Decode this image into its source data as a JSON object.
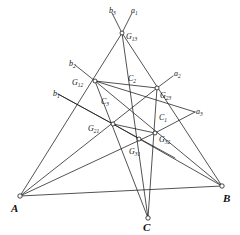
{
  "figure": {
    "stroke_color": "#1a1a1a",
    "node_fill": "#ffffff",
    "background": "#ffffff"
  },
  "vertices": [
    {
      "id": "A",
      "label": "A",
      "x": 20,
      "y": 196,
      "label_x": 11,
      "label_y": 203
    },
    {
      "id": "B",
      "label": "B",
      "x": 222,
      "y": 186,
      "label_x": 223,
      "label_y": 193
    },
    {
      "id": "C",
      "label": "C",
      "x": 148,
      "y": 218,
      "label_x": 143,
      "label_y": 222
    }
  ],
  "g_points": [
    {
      "id": "G13",
      "base": "G",
      "sub": "13",
      "x": 122,
      "y": 33,
      "label_x": 126,
      "label_y": 33
    },
    {
      "id": "G12",
      "base": "G",
      "sub": "12",
      "x": 95,
      "y": 81,
      "label_x": 72,
      "label_y": 79
    },
    {
      "id": "G23",
      "base": "G",
      "sub": "23",
      "x": 157,
      "y": 88,
      "label_x": 160,
      "label_y": 92
    },
    {
      "id": "G21",
      "base": "G",
      "sub": "21",
      "x": 113,
      "y": 124,
      "label_x": 88,
      "label_y": 125
    },
    {
      "id": "G32",
      "base": "G",
      "sub": "32",
      "x": 155,
      "y": 133,
      "label_x": 159,
      "label_y": 136
    },
    {
      "id": "G31",
      "base": "G",
      "sub": "31",
      "x": 139,
      "y": 139,
      "label_x": 129,
      "label_y": 148
    }
  ],
  "line_labels": [
    {
      "id": "a1",
      "base": "a",
      "sub": "1",
      "x": 131,
      "y": 7
    },
    {
      "id": "b3",
      "base": "b",
      "sub": "3",
      "x": 109,
      "y": 7
    },
    {
      "id": "b2",
      "base": "b",
      "sub": "2",
      "x": 69,
      "y": 60
    },
    {
      "id": "b1",
      "base": "b",
      "sub": "1",
      "x": 53,
      "y": 90
    },
    {
      "id": "a2",
      "base": "a",
      "sub": "2",
      "x": 174,
      "y": 70
    },
    {
      "id": "a3",
      "base": "a",
      "sub": "3",
      "x": 196,
      "y": 108
    },
    {
      "id": "C1",
      "base": "C",
      "sub": "1",
      "x": 159,
      "y": 114
    },
    {
      "id": "C2",
      "base": "C",
      "sub": "2",
      "x": 128,
      "y": 75
    },
    {
      "id": "C3",
      "base": "C",
      "sub": "3",
      "x": 101,
      "y": 98
    }
  ],
  "segments": [
    {
      "id": "b3-stub",
      "x1": 112,
      "y1": 13,
      "x2": 122,
      "y2": 33
    },
    {
      "id": "a1-stub",
      "x1": 132,
      "y1": 13,
      "x2": 122,
      "y2": 33
    },
    {
      "id": "b2-stub",
      "x1": 75,
      "y1": 65,
      "x2": 95,
      "y2": 81
    },
    {
      "id": "b1-stub",
      "x1": 58,
      "y1": 94,
      "x2": 113,
      "y2": 124
    },
    {
      "id": "a2-stub",
      "x1": 173,
      "y1": 76,
      "x2": 157,
      "y2": 88
    },
    {
      "id": "a3-stub",
      "x1": 195,
      "y1": 112,
      "x2": 155,
      "y2": 133
    },
    {
      "id": "A-G13",
      "x1": 20,
      "y1": 196,
      "x2": 122,
      "y2": 33
    },
    {
      "id": "A-G23",
      "x1": 20,
      "y1": 196,
      "x2": 157,
      "y2": 88
    },
    {
      "id": "A-G32",
      "x1": 20,
      "y1": 196,
      "x2": 155,
      "y2": 133
    },
    {
      "id": "A-B",
      "x1": 20,
      "y1": 196,
      "x2": 222,
      "y2": 186
    },
    {
      "id": "B-G13",
      "x1": 222,
      "y1": 186,
      "x2": 122,
      "y2": 33
    },
    {
      "id": "B-G12",
      "x1": 222,
      "y1": 186,
      "x2": 95,
      "y2": 81
    },
    {
      "id": "B-G21",
      "x1": 222,
      "y1": 186,
      "x2": 113,
      "y2": 124
    },
    {
      "id": "C-G13",
      "x1": 148,
      "y1": 218,
      "x2": 122,
      "y2": 33
    },
    {
      "id": "C-G12",
      "x1": 148,
      "y1": 218,
      "x2": 95,
      "y2": 81
    },
    {
      "id": "C-G23",
      "x1": 148,
      "y1": 218,
      "x2": 157,
      "y2": 88
    },
    {
      "id": "G12-G23",
      "x1": 95,
      "y1": 81,
      "x2": 157,
      "y2": 88
    },
    {
      "id": "G21-G32",
      "x1": 113,
      "y1": 124,
      "x2": 155,
      "y2": 133
    },
    {
      "id": "b1-through",
      "x1": 58,
      "y1": 94,
      "x2": 175,
      "y2": 158
    },
    {
      "id": "a3-through",
      "x1": 195,
      "y1": 112,
      "x2": 95,
      "y2": 81
    }
  ]
}
